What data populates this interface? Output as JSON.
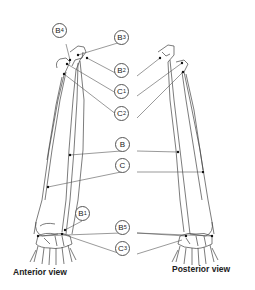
{
  "diagram": {
    "views": [
      {
        "id": "anterior",
        "caption": "Anterior view"
      },
      {
        "id": "posterior",
        "caption": "Posterior view"
      }
    ],
    "labels": [
      {
        "id": "B4",
        "main": "B",
        "sub": "4",
        "x": 59,
        "y": 30
      },
      {
        "id": "B3",
        "main": "B",
        "sub": "3",
        "x": 121,
        "y": 37
      },
      {
        "id": "B2",
        "main": "B",
        "sub": "2",
        "x": 121,
        "y": 70
      },
      {
        "id": "C1",
        "main": "C",
        "sub": "1",
        "x": 121,
        "y": 90
      },
      {
        "id": "C2",
        "main": "C",
        "sub": "2",
        "x": 121,
        "y": 112
      },
      {
        "id": "B",
        "main": "B",
        "sub": "",
        "x": 122,
        "y": 143
      },
      {
        "id": "C",
        "main": "C",
        "sub": "",
        "x": 122,
        "y": 164
      },
      {
        "id": "B1",
        "main": "B",
        "sub": "1",
        "x": 82,
        "y": 212
      },
      {
        "id": "B5",
        "main": "B",
        "sub": "5",
        "x": 122,
        "y": 225
      },
      {
        "id": "C3",
        "main": "C",
        "sub": "3",
        "x": 122,
        "y": 246
      }
    ],
    "colors": {
      "line": "#555555",
      "bone": "#333333",
      "background": "#ffffff"
    }
  }
}
